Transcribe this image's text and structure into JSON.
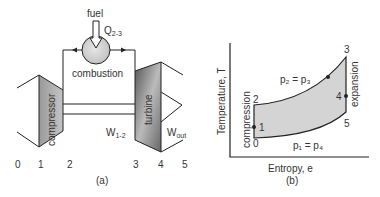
{
  "panel_a": {
    "caption": "(a)",
    "fuel_label": "fuel",
    "heat_label": "Q",
    "heat_sub": "2-3",
    "combustion_label": "combustion",
    "compressor_label": "compressor",
    "turbine_label": "turbine",
    "work_in_label": "W",
    "work_in_sub": "1-2",
    "work_out_label": "W",
    "work_out_sub": "out",
    "stations": [
      "0",
      "1",
      "2",
      "3",
      "4",
      "5"
    ]
  },
  "panel_b": {
    "caption": "(b)",
    "y_axis_label": "Temperature, T",
    "x_axis_label": "Entropy, e",
    "high_pressure_label": "p₂ = p₃",
    "low_pressure_label": "p₁ = p₄",
    "compression_label": "compression",
    "expansion_label": "expansion",
    "points": [
      "0",
      "1",
      "2",
      "3",
      "4",
      "5"
    ]
  },
  "colors": {
    "line": "#222222",
    "fill": "#d4d4d4",
    "text": "#333333"
  }
}
